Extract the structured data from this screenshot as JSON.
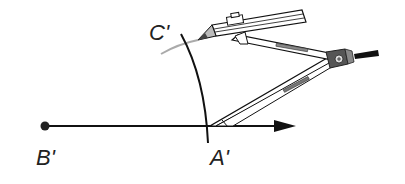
{
  "diagram": {
    "points": {
      "B_prime": {
        "label": "B'",
        "x": 45,
        "y": 126
      },
      "A_prime": {
        "label": "A'",
        "x": 209,
        "y": 126
      },
      "C_prime": {
        "label": "C'"
      }
    },
    "ray": {
      "from": "B'",
      "direction": "right",
      "arrow": true
    },
    "arc": {
      "center": "B'",
      "through": "A'",
      "color": "#111111"
    },
    "pencil_trace": {
      "color": "#aaaaaa"
    },
    "tool": "compass-with-pencil"
  },
  "colors": {
    "stroke": "#111111",
    "trace": "#aaaaaa",
    "hinge": "#555555",
    "background": "#ffffff"
  }
}
